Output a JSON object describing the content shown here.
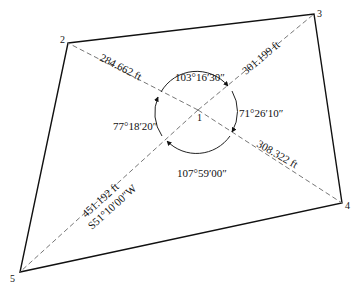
{
  "diagram": {
    "type": "survey-traverse-radiation",
    "stations": [
      {
        "id": "1",
        "label": "1",
        "x": 198,
        "y": 110
      },
      {
        "id": "2",
        "label": "2",
        "x": 68,
        "y": 43
      },
      {
        "id": "3",
        "label": "3",
        "x": 314,
        "y": 14
      },
      {
        "id": "4",
        "label": "4",
        "x": 342,
        "y": 203
      },
      {
        "id": "5",
        "label": "5",
        "x": 20,
        "y": 272
      }
    ],
    "radial_lines": [
      {
        "from": "1",
        "to": "2",
        "distance": "284.662 ft"
      },
      {
        "from": "1",
        "to": "3",
        "distance": "301.199 ft"
      },
      {
        "from": "1",
        "to": "4",
        "distance": "308.322 ft"
      },
      {
        "from": "1",
        "to": "5",
        "distance": "451.192 ft",
        "bearing": "S51°10′00″W"
      }
    ],
    "angles": [
      {
        "between": [
          "2",
          "3"
        ],
        "value": "103°16′30″"
      },
      {
        "between": [
          "3",
          "4"
        ],
        "value": "71°26′10″"
      },
      {
        "between": [
          "4",
          "5"
        ],
        "value": "107°59′00″"
      },
      {
        "between": [
          "5",
          "2"
        ],
        "value": "77°18′20″"
      }
    ],
    "colors": {
      "line": "#111111",
      "dashed": "#777777",
      "background": "#ffffff"
    }
  }
}
